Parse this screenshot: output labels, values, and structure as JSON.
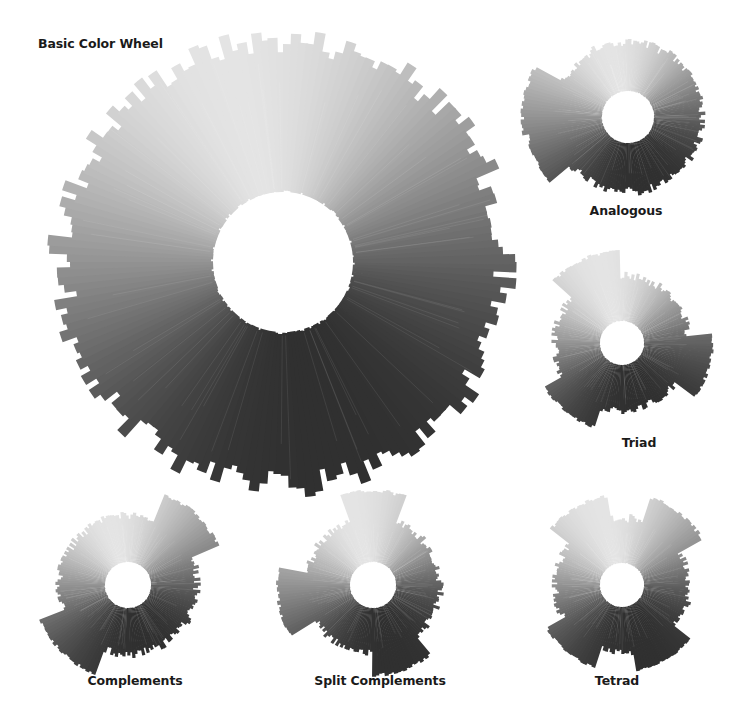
{
  "title": "Basic Color Wheel",
  "wheels": [
    {
      "id": "basic",
      "label": "Basic Color Wheel",
      "cx": 283,
      "cy": 262,
      "r_outer": 232,
      "r_inner": 70,
      "extensions": []
    },
    {
      "id": "analogous",
      "label": "Analogous",
      "cx": 628,
      "cy": 117,
      "r_outer": 78,
      "r_inner": 26,
      "extensions": [
        {
          "angle": 190,
          "len": 30,
          "width": 26
        },
        {
          "angle": 160,
          "len": 26,
          "width": 28
        }
      ]
    },
    {
      "id": "triad",
      "label": "Triad",
      "cx": 622,
      "cy": 343,
      "r_outer": 70,
      "r_inner": 22,
      "extensions": [
        {
          "angle": 245,
          "len": 24,
          "width": 28
        },
        {
          "angle": 15,
          "len": 22,
          "width": 26
        },
        {
          "angle": 130,
          "len": 20,
          "width": 26
        }
      ]
    },
    {
      "id": "complements",
      "label": "Complements",
      "cx": 128,
      "cy": 585,
      "r_outer": 72,
      "r_inner": 23,
      "extensions": [
        {
          "angle": 315,
          "len": 28,
          "width": 28
        },
        {
          "angle": 135,
          "len": 24,
          "width": 30
        }
      ]
    },
    {
      "id": "split-complements",
      "label": "Split Complements",
      "cx": 373,
      "cy": 585,
      "r_outer": 70,
      "r_inner": 23,
      "extensions": [
        {
          "angle": 270,
          "len": 26,
          "width": 24
        },
        {
          "angle": 170,
          "len": 28,
          "width": 26
        },
        {
          "angle": 70,
          "len": 22,
          "width": 24
        }
      ]
    },
    {
      "id": "tetrad",
      "label": "Tetrad",
      "cx": 622,
      "cy": 585,
      "r_outer": 70,
      "r_inner": 22,
      "extensions": [
        {
          "angle": 240,
          "len": 22,
          "width": 26
        },
        {
          "angle": 310,
          "len": 24,
          "width": 26
        },
        {
          "angle": 60,
          "len": 18,
          "width": 26
        },
        {
          "angle": 130,
          "len": 18,
          "width": 26
        }
      ]
    }
  ],
  "labels": {
    "basic": "Basic Color Wheel",
    "analogous": "Analogous",
    "triad": "Triad",
    "complements": "Complements",
    "split_complements": "Split Complements",
    "tetrad": "Tetrad"
  },
  "colors": {
    "background": "#ffffff",
    "lightest": "#e4e4e4",
    "mid": "#9a9a9a",
    "darkest": "#2e2e2e",
    "text": "#1a1a1a"
  }
}
